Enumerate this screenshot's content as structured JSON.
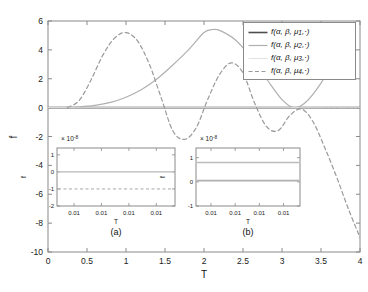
{
  "chart_data": {
    "type": "line",
    "title": "",
    "xlabel": "T",
    "ylabel": "f",
    "xlim": [
      0,
      4
    ],
    "ylim": [
      -10,
      6
    ],
    "xticks": [
      "0",
      "0.5",
      "1",
      "1.5",
      "2",
      "2.5",
      "3",
      "3.5",
      "4"
    ],
    "xtick_values": [
      0,
      0.5,
      1,
      1.5,
      2,
      2.5,
      3,
      3.5,
      4
    ],
    "yticks": [
      "6",
      "4",
      "2",
      "0",
      "-2",
      "-4",
      "-6",
      "-8",
      "-10"
    ],
    "ytick_values": [
      6,
      4,
      2,
      0,
      -2,
      -4,
      -6,
      -8,
      -10
    ],
    "grid": false,
    "legend_position": "upper right",
    "series": [
      {
        "name": "f(a, b, m1, .)",
        "label_parts": {
          "prefix": "f(",
          "a": "α",
          "b": "β",
          "mu": "μ",
          "index": "1",
          "suffix": ",·)"
        },
        "style": "solid",
        "color": "#4d4d4d",
        "width": 1.6,
        "x": [
          0,
          0.5,
          1,
          1.5,
          2,
          2.5,
          3,
          3.5,
          4
        ],
        "y": [
          0,
          0,
          0,
          0,
          0,
          0,
          0,
          0,
          0
        ]
      },
      {
        "name": "f(a, b, m2, .)",
        "label_parts": {
          "prefix": "f(",
          "a": "α",
          "b": "β",
          "mu": "μ",
          "index": "2",
          "suffix": ",·)"
        },
        "style": "solid",
        "color": "#b0b0b0",
        "width": 1.2,
        "x": [
          0,
          0.2,
          0.4,
          0.6,
          0.8,
          1.0,
          1.2,
          1.4,
          1.6,
          1.8,
          2.0,
          2.1,
          2.2,
          2.4,
          2.6,
          2.8,
          3.0,
          3.15,
          3.3,
          3.5,
          3.7,
          3.85,
          4.0
        ],
        "y": [
          0,
          0.02,
          0.06,
          0.16,
          0.36,
          0.72,
          1.25,
          2.0,
          2.95,
          4.0,
          5.2,
          5.4,
          5.35,
          4.7,
          3.5,
          2.0,
          0.55,
          0.0,
          0.35,
          1.7,
          3.6,
          5.1,
          6.6
        ]
      },
      {
        "name": "f(a, b, m3, .)",
        "label_parts": {
          "prefix": "f(",
          "a": "α",
          "b": "β",
          "mu": "μ",
          "index": "3",
          "suffix": ",·)"
        },
        "style": "solid",
        "color": "#e2e2e2",
        "width": 1.0,
        "x": [
          0,
          0.5,
          1,
          1.5,
          2,
          2.5,
          3,
          3.5,
          4
        ],
        "y": [
          0,
          0,
          0,
          0,
          0,
          0,
          0,
          0,
          0
        ]
      },
      {
        "name": "f(a, b, m4, .)",
        "label_parts": {
          "prefix": "f(",
          "a": "α",
          "b": "β",
          "mu": "μ",
          "index": "4",
          "suffix": ",·)"
        },
        "style": "dashed",
        "color": "#9a9a9a",
        "width": 1.2,
        "x": [
          0.25,
          0.4,
          0.55,
          0.7,
          0.85,
          1.0,
          1.15,
          1.3,
          1.45,
          1.6,
          1.75,
          1.9,
          2.05,
          2.2,
          2.35,
          2.5,
          2.65,
          2.8,
          2.95,
          3.1,
          3.25,
          3.4,
          3.55,
          3.7,
          3.85,
          4.0
        ],
        "y": [
          0.0,
          0.5,
          1.9,
          3.6,
          4.8,
          5.2,
          4.6,
          3.0,
          0.7,
          -1.6,
          -2.2,
          -1.4,
          0.6,
          2.3,
          3.1,
          2.4,
          0.3,
          -1.3,
          -1.6,
          -0.55,
          -0.1,
          -1.0,
          -2.8,
          -4.8,
          -7.0,
          -9.0
        ]
      }
    ],
    "insets": [
      {
        "caption": "(a)",
        "xlabel": "T",
        "ylabel": "f",
        "exponent_label": "× 10",
        "exponent_power": "-8",
        "yticks": [
          "1",
          "0",
          "-1",
          "-2"
        ],
        "ytick_values": [
          1,
          0,
          -1,
          -2
        ],
        "ylim": [
          -2,
          1.4
        ],
        "xticks": [
          "0.01",
          "0.01",
          "0.01",
          "0.01"
        ],
        "lines": [
          {
            "value": 0.0,
            "style": "solid",
            "color": "#b8b8b8",
            "width": 1.2
          },
          {
            "value": -1.0,
            "style": "dashed",
            "color": "#a8a8a8",
            "width": 1.0
          }
        ]
      },
      {
        "caption": "(b)",
        "xlabel": "T",
        "ylabel": "f",
        "exponent_label": "× 10",
        "exponent_power": "-8",
        "yticks": [
          "1",
          "0",
          "-1"
        ],
        "ytick_values": [
          1,
          0,
          -1
        ],
        "ylim": [
          -1,
          1.4
        ],
        "xticks": [
          "0.01",
          "0.01",
          "0.01",
          "0.01"
        ],
        "lines": [
          {
            "value": 0.8,
            "style": "solid",
            "color": "#bcbcbc",
            "width": 1.3
          },
          {
            "value": 0.05,
            "style": "solid",
            "color": "#b0b0b0",
            "width": 1.6
          }
        ]
      }
    ]
  },
  "colors": {
    "axis": "#8a8a8a",
    "text": "#111111",
    "background": "#ffffff"
  }
}
